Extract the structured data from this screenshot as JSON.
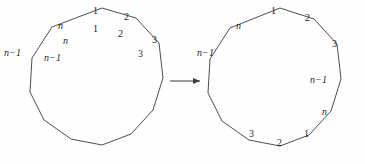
{
  "figure": {
    "background_color": "#fefefe",
    "stroke_color": "#3a3a3a",
    "text_color": "#1e1e1e",
    "arrow": {
      "name": "transformation-arrow",
      "direction": "right",
      "label": ""
    },
    "left_polygon": {
      "name": "left-polygon",
      "sides": 12,
      "outer_labels": [
        "n-1",
        "n",
        "1",
        "2",
        "3"
      ],
      "inner_labels": [
        "n-1",
        "n",
        "1",
        "2",
        "3"
      ],
      "labels": [
        {
          "id": "L-out-nminus1",
          "text": "n−1",
          "italic_lead": true,
          "x": 4,
          "y": 48,
          "placement": "outside"
        },
        {
          "id": "L-in-nminus1",
          "text": "n−1",
          "italic_lead": true,
          "x": 44,
          "y": 53,
          "placement": "inside"
        },
        {
          "id": "L-out-n",
          "text": "n",
          "italic_lead": true,
          "x": 58,
          "y": 21,
          "placement": "outside"
        },
        {
          "id": "L-in-n",
          "text": "n",
          "italic_lead": true,
          "x": 63,
          "y": 36,
          "placement": "inside"
        },
        {
          "id": "L-out-1",
          "text": "1",
          "italic_lead": false,
          "x": 93,
          "y": 6,
          "placement": "outside"
        },
        {
          "id": "L-in-1",
          "text": "1",
          "italic_lead": false,
          "x": 93,
          "y": 24,
          "placement": "inside"
        },
        {
          "id": "L-out-2",
          "text": "2",
          "italic_lead": false,
          "x": 124,
          "y": 12,
          "placement": "outside"
        },
        {
          "id": "L-in-2",
          "text": "2",
          "italic_lead": false,
          "x": 118,
          "y": 29,
          "placement": "inside"
        },
        {
          "id": "L-out-3",
          "text": "3",
          "italic_lead": false,
          "x": 152,
          "y": 35,
          "placement": "outside"
        },
        {
          "id": "L-in-3",
          "text": "3",
          "italic_lead": false,
          "x": 138,
          "y": 49,
          "placement": "inside"
        }
      ]
    },
    "right_polygon": {
      "name": "right-polygon",
      "sides": 12,
      "labels": [
        {
          "id": "R-nminus1-left",
          "text": "n−1",
          "italic_lead": true,
          "x": 197,
          "y": 48,
          "placement": "outside"
        },
        {
          "id": "R-n-top",
          "text": "n",
          "italic_lead": true,
          "x": 236,
          "y": 21,
          "placement": "outside"
        },
        {
          "id": "R-1-top",
          "text": "1",
          "italic_lead": false,
          "x": 271,
          "y": 6,
          "placement": "outside"
        },
        {
          "id": "R-2-top",
          "text": "2",
          "italic_lead": false,
          "x": 305,
          "y": 13,
          "placement": "outside"
        },
        {
          "id": "R-3-top",
          "text": "3",
          "italic_lead": false,
          "x": 332,
          "y": 39,
          "placement": "outside"
        },
        {
          "id": "R-nminus1-right",
          "text": "n−1",
          "italic_lead": true,
          "x": 310,
          "y": 75,
          "placement": "inside"
        },
        {
          "id": "R-n-right",
          "text": "n",
          "italic_lead": true,
          "x": 322,
          "y": 107,
          "placement": "inside"
        },
        {
          "id": "R-1-bottom",
          "text": "1",
          "italic_lead": false,
          "x": 304,
          "y": 129,
          "placement": "inside"
        },
        {
          "id": "R-2-bottom",
          "text": "2",
          "italic_lead": false,
          "x": 277,
          "y": 138,
          "placement": "inside"
        },
        {
          "id": "R-3-bottom",
          "text": "3",
          "italic_lead": false,
          "x": 249,
          "y": 129,
          "placement": "inside"
        }
      ]
    }
  }
}
